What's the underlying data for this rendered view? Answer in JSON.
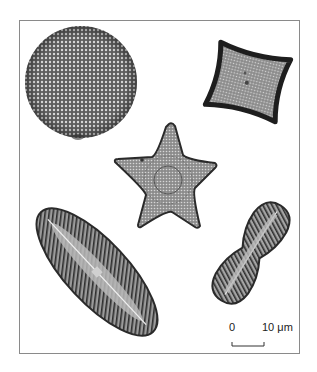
{
  "figure": {
    "specimens": [
      {
        "name": "circular-centric-diatom",
        "shape": "disc"
      },
      {
        "name": "square-centric-diatom",
        "shape": "rounded square"
      },
      {
        "name": "star-shaped-diatom",
        "shape": "five-pointed star"
      },
      {
        "name": "elongate-pennate-diatom",
        "shape": "elliptical / lanceolate"
      },
      {
        "name": "constricted-pennate-diatom",
        "shape": "waisted / peanut"
      }
    ],
    "scale_bar": {
      "start_label": "0",
      "end_label": "10 μm",
      "length_um": 10
    }
  }
}
